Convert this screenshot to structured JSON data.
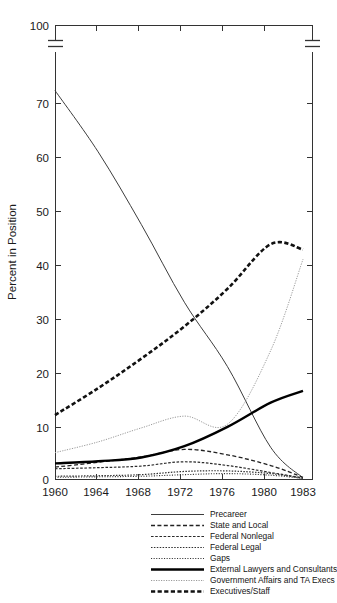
{
  "chart_data": {
    "type": "line",
    "title": "",
    "xlabel": "",
    "ylabel": "Percent in Position",
    "x": [
      1960,
      1964,
      1968,
      1972,
      1976,
      1980,
      1983
    ],
    "xticklabels": [
      "1960",
      "1964",
      "1968",
      "1972",
      "1976",
      "1980",
      "1983"
    ],
    "yticklabels": [
      "0",
      "10",
      "20",
      "30",
      "40",
      "50",
      "60",
      "70",
      "100"
    ],
    "ytickvalues": [
      0,
      10,
      20,
      30,
      40,
      50,
      60,
      70,
      100
    ],
    "ylim": [
      0,
      100
    ],
    "axis_break": {
      "present": true,
      "between": [
        70,
        100
      ],
      "note": "broken y-axis between 70 and 100"
    },
    "grid": false,
    "legend_position": "below",
    "series": [
      {
        "name": "Precareer",
        "style": "thin-solid",
        "color": "#3d3d3d",
        "values": [
          75.0,
          61.0,
          47.5,
          33.0,
          21.0,
          6.0,
          0.3
        ]
      },
      {
        "name": "State and Local",
        "style": "dashed",
        "color": "#222222",
        "values": [
          2.3,
          3.2,
          4.2,
          5.6,
          4.6,
          2.6,
          0.4
        ]
      },
      {
        "name": "Federal Nonlegal",
        "style": "fine-dashed",
        "color": "#2b2b2b",
        "values": [
          2.0,
          2.2,
          2.5,
          3.3,
          2.6,
          1.3,
          0.3
        ]
      },
      {
        "name": "Federal Legal",
        "style": "dotted",
        "color": "#303030",
        "values": [
          0.6,
          0.7,
          0.9,
          1.5,
          1.6,
          1.1,
          0.2
        ]
      },
      {
        "name": "Gaps",
        "style": "dotted-fine",
        "color": "#353535",
        "values": [
          0.4,
          0.5,
          0.6,
          0.9,
          1.1,
          0.8,
          0.2
        ]
      },
      {
        "name": "External Lawyers and Consultants",
        "style": "thick-solid",
        "color": "#000000",
        "values": [
          3.0,
          3.4,
          4.1,
          6.2,
          9.8,
          14.3,
          16.5
        ]
      },
      {
        "name": "Government Affairs and TA Execs",
        "style": "light-dotted",
        "color": "#9a9a9a",
        "values": [
          5.0,
          7.0,
          9.6,
          11.8,
          10.3,
          24.0,
          41.0
        ]
      },
      {
        "name": "Executives/Staff",
        "style": "thick-dashed",
        "color": "#111111",
        "values": [
          12.0,
          17.0,
          22.5,
          28.5,
          35.5,
          43.8,
          42.8
        ]
      }
    ]
  },
  "figure": {
    "y_axis_title": "Percent in Position",
    "x_tick_labels": [
      "1960",
      "1964",
      "1968",
      "1972",
      "1976",
      "1980",
      "1983"
    ],
    "y_tick_labels": [
      "100",
      "70",
      "60",
      "50",
      "40",
      "30",
      "20",
      "10",
      "0"
    ]
  },
  "legend": {
    "items": [
      {
        "label": "Precareer",
        "swatch": "thin-solid-line-icon"
      },
      {
        "label": "State and Local",
        "swatch": "dashed-line-icon"
      },
      {
        "label": "Federal Nonlegal",
        "swatch": "fine-dashed-line-icon"
      },
      {
        "label": "Federal Legal",
        "swatch": "dotted-line-icon"
      },
      {
        "label": "Gaps",
        "swatch": "dotted-fine-line-icon"
      },
      {
        "label": "External Lawyers and Consultants",
        "swatch": "thick-solid-line-icon"
      },
      {
        "label": "Government Affairs and TA Execs",
        "swatch": "light-dotted-line-icon"
      },
      {
        "label": "Executives/Staff",
        "swatch": "thick-dashed-line-icon"
      }
    ]
  }
}
